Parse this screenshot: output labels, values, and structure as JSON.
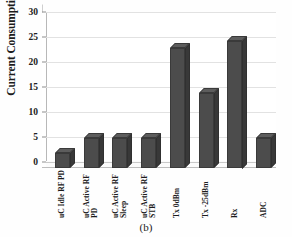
{
  "caption": "(b)",
  "chart_data": {
    "type": "bar",
    "title": "",
    "xlabel": "",
    "ylabel": "Current Consumption (mA)",
    "ylim": [
      0,
      30
    ],
    "yticks": [
      0,
      5,
      10,
      15,
      20,
      25,
      30
    ],
    "grid": true,
    "legend": false,
    "style": "3d-column",
    "bar_color": "#4c4c4c",
    "categories": [
      "uC Idle RF PD",
      "uC Active RF PD",
      "uC Active RF Sleep",
      "uC Active RF STB",
      "Tx 0dBm",
      "Tx -25dBm",
      "Rx",
      "ADC"
    ],
    "category_lines": [
      [
        "uC Idle RF PD"
      ],
      [
        "uC Active RF",
        "PD"
      ],
      [
        "uC Active RF",
        "Sleep"
      ],
      [
        "uC Active RF",
        "STB"
      ],
      [
        "Tx 0dBm"
      ],
      [
        "Tx -25dBm"
      ],
      [
        "Rx"
      ],
      [
        "ADC"
      ]
    ],
    "values": [
      3,
      6,
      6,
      6,
      24,
      15,
      25.5,
      6
    ],
    "units": "mA"
  }
}
